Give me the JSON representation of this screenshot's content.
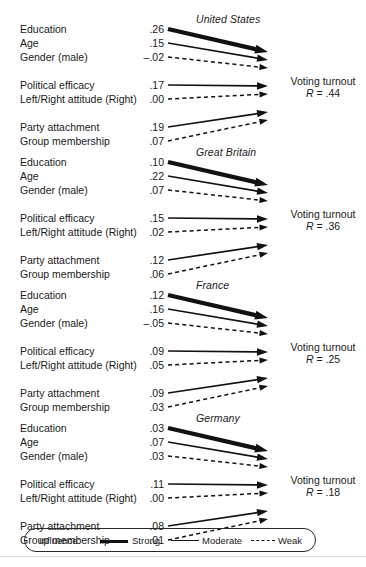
{
  "figure": {
    "outcome_label": "Voting turnout",
    "outcome_r_prefix": "R",
    "outcome_r_eq": " = ",
    "row_labels": [
      "Education",
      "Age",
      "Gender (male)",
      "Political efficacy",
      "Left/Right attitude (Right)",
      "Party attachment",
      "Group membership"
    ]
  },
  "legend": {
    "title": "Influence:",
    "items": [
      {
        "label": "Strong",
        "style": "strong"
      },
      {
        "label": "Moderate",
        "style": "moderate"
      },
      {
        "label": "Weak",
        "style": "weak"
      }
    ]
  },
  "colors": {
    "ink": "#1a1a1a",
    "line": "#111111",
    "background": "#ffffff",
    "rule": "#d9d9d9"
  },
  "chart_data": {
    "type": "diagram",
    "title": "",
    "outcome": "Voting turnout",
    "predictors": [
      "Education",
      "Age",
      "Gender (male)",
      "Political efficacy",
      "Left/Right attitude (Right)",
      "Party attachment",
      "Group membership"
    ],
    "influence_levels": [
      "Strong",
      "Moderate",
      "Weak"
    ],
    "panels": [
      {
        "country": "United States",
        "r_value": ".44",
        "r_label": "R = .44",
        "coefficients": [
          {
            "predictor": "Education",
            "value": ".26",
            "numeric": 0.26,
            "influence": "strong"
          },
          {
            "predictor": "Age",
            "value": ".15",
            "numeric": 0.15,
            "influence": "moderate"
          },
          {
            "predictor": "Gender (male)",
            "value": "–.02",
            "numeric": -0.02,
            "influence": "weak"
          },
          {
            "predictor": "Political efficacy",
            "value": ".17",
            "numeric": 0.17,
            "influence": "moderate"
          },
          {
            "predictor": "Left/Right attitude (Right)",
            "value": ".00",
            "numeric": 0.0,
            "influence": "weak"
          },
          {
            "predictor": "Party attachment",
            "value": ".19",
            "numeric": 0.19,
            "influence": "moderate"
          },
          {
            "predictor": "Group membership",
            "value": ".07",
            "numeric": 0.07,
            "influence": "weak"
          }
        ]
      },
      {
        "country": "Great Britain",
        "r_value": ".36",
        "r_label": "R = .36",
        "coefficients": [
          {
            "predictor": "Education",
            "value": ".10",
            "numeric": 0.1,
            "influence": "strong"
          },
          {
            "predictor": "Age",
            "value": ".22",
            "numeric": 0.22,
            "influence": "moderate"
          },
          {
            "predictor": "Gender (male)",
            "value": ".07",
            "numeric": 0.07,
            "influence": "weak"
          },
          {
            "predictor": "Political efficacy",
            "value": ".15",
            "numeric": 0.15,
            "influence": "moderate"
          },
          {
            "predictor": "Left/Right attitude (Right)",
            "value": ".02",
            "numeric": 0.02,
            "influence": "weak"
          },
          {
            "predictor": "Party attachment",
            "value": ".12",
            "numeric": 0.12,
            "influence": "moderate"
          },
          {
            "predictor": "Group membership",
            "value": ".06",
            "numeric": 0.06,
            "influence": "weak"
          }
        ]
      },
      {
        "country": "France",
        "r_value": ".25",
        "r_label": "R = .25",
        "coefficients": [
          {
            "predictor": "Education",
            "value": ".12",
            "numeric": 0.12,
            "influence": "strong"
          },
          {
            "predictor": "Age",
            "value": ".16",
            "numeric": 0.16,
            "influence": "moderate"
          },
          {
            "predictor": "Gender (male)",
            "value": "–.05",
            "numeric": -0.05,
            "influence": "weak"
          },
          {
            "predictor": "Political efficacy",
            "value": ".09",
            "numeric": 0.09,
            "influence": "moderate"
          },
          {
            "predictor": "Left/Right attitude (Right)",
            "value": ".05",
            "numeric": 0.05,
            "influence": "weak"
          },
          {
            "predictor": "Party attachment",
            "value": ".09",
            "numeric": 0.09,
            "influence": "moderate"
          },
          {
            "predictor": "Group membership",
            "value": ".03",
            "numeric": 0.03,
            "influence": "weak"
          }
        ]
      },
      {
        "country": "Germany",
        "r_value": ".18",
        "r_label": "R = .18",
        "coefficients": [
          {
            "predictor": "Education",
            "value": ".03",
            "numeric": 0.03,
            "influence": "strong"
          },
          {
            "predictor": "Age",
            "value": ".07",
            "numeric": 0.07,
            "influence": "moderate"
          },
          {
            "predictor": "Gender (male)",
            "value": ".03",
            "numeric": 0.03,
            "influence": "weak"
          },
          {
            "predictor": "Political efficacy",
            "value": ".11",
            "numeric": 0.11,
            "influence": "moderate"
          },
          {
            "predictor": "Left/Right attitude (Right)",
            "value": ".00",
            "numeric": 0.0,
            "influence": "weak"
          },
          {
            "predictor": "Party attachment",
            "value": ".08",
            "numeric": 0.08,
            "influence": "moderate"
          },
          {
            "predictor": "Group membership",
            "value": ".01",
            "numeric": 0.01,
            "influence": "weak"
          }
        ]
      }
    ]
  }
}
